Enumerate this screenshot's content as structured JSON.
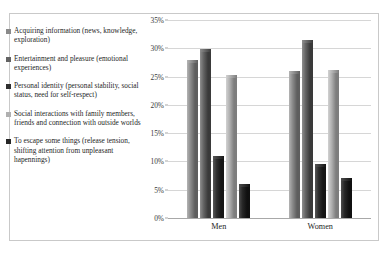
{
  "chart_data": {
    "type": "bar",
    "title": "",
    "xlabel": "",
    "ylabel": "",
    "categories": [
      "Men",
      "Women"
    ],
    "ylim": [
      0,
      35
    ],
    "ytick_labels": [
      "0%",
      "5%",
      "10%",
      "15%",
      "20%",
      "25%",
      "30%",
      "35%"
    ],
    "ytick_values": [
      0,
      5,
      10,
      15,
      20,
      25,
      30,
      35
    ],
    "grid": true,
    "legend_position": "left",
    "series": [
      {
        "name": "Acquiring information (news, knowledge, exploration)",
        "color": "#8a8a8a",
        "side_color": "#5e5e5e",
        "top_color": "#b4b4b4",
        "values": [
          27.9,
          26.0
        ]
      },
      {
        "name": "Entertainment and pleasure (emotional experiences)",
        "color": "#636363",
        "side_color": "#3a3a3a",
        "top_color": "#8e8e8e",
        "values": [
          29.8,
          31.5
        ]
      },
      {
        "name": "Personal identity (personal stability, social status, need for self-respect)",
        "color": "#2f2f2f",
        "side_color": "#151515",
        "top_color": "#575757",
        "values": [
          11.0,
          9.6
        ]
      },
      {
        "name": "Social interactions with family members, friends and connection with outside worlds",
        "color": "#b0b0b0",
        "side_color": "#7d7d7d",
        "top_color": "#d2d2d2",
        "values": [
          25.3,
          26.2
        ]
      },
      {
        "name": "To escape some things (release tension, shifting attention from unpleasant hapennings)",
        "color": "#262626",
        "side_color": "#101010",
        "top_color": "#4c4c4c",
        "values": [
          6.0,
          7.0
        ]
      }
    ]
  }
}
